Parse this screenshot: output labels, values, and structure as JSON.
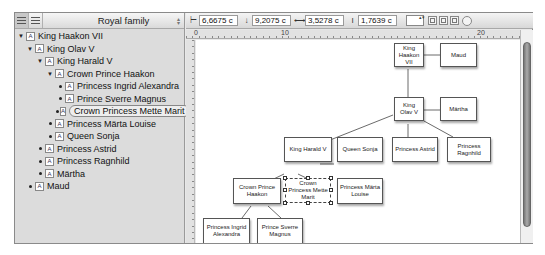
{
  "outline": {
    "title": "Royal family",
    "view_buttons": [
      "outline-view",
      "list-view"
    ],
    "items": [
      {
        "label": "King Haakon VII",
        "level": 0,
        "type": "expanded"
      },
      {
        "label": "King Olav V",
        "level": 1,
        "type": "expanded"
      },
      {
        "label": "King Harald V",
        "level": 2,
        "type": "expanded"
      },
      {
        "label": "Crown Prince Haakon",
        "level": 3,
        "type": "expanded"
      },
      {
        "label": "Princess Ingrid Alexandra",
        "level": 4,
        "type": "leaf"
      },
      {
        "label": "Prince Sverre Magnus",
        "level": 4,
        "type": "leaf"
      },
      {
        "label": "Crown Princess Mette Marit",
        "level": 4,
        "type": "leaf",
        "selected": true
      },
      {
        "label": "Princess Märta Louise",
        "level": 3,
        "type": "leaf"
      },
      {
        "label": "Queen Sonja",
        "level": 3,
        "type": "leaf"
      },
      {
        "label": "Princess Astrid",
        "level": 2,
        "type": "leaf"
      },
      {
        "label": "Princess Ragnhild",
        "level": 2,
        "type": "leaf"
      },
      {
        "label": "Märtha",
        "level": 2,
        "type": "leaf"
      },
      {
        "label": "Maud",
        "level": 1,
        "type": "leaf"
      }
    ],
    "node_icon_glyph": "A"
  },
  "toolbar": {
    "x": "6,6675 c",
    "y": "9,2075 c",
    "width": "3,5278 c",
    "height": "1,7639 c"
  },
  "ruler": {
    "h_labels": [
      "0",
      "10",
      "20"
    ]
  },
  "diagram": {
    "nodes": {
      "haakon7": "King Haakon VII",
      "maud": "Maud",
      "olav": "King Olav V",
      "martha": "Märtha",
      "harald": "King Harald V",
      "sonja": "Queen Sonja",
      "astrid": "Princess Astrid",
      "ragnhild": "Princess Ragnhild",
      "haakon": "Crown Prince Haakon",
      "mette": "Crown Princess Mette Marit",
      "marta": "Princess Märta Louise",
      "ingrid": "Princess Ingrid Alexandra",
      "sverre": "Prince Sverre Magnus"
    },
    "selected": "mette"
  }
}
